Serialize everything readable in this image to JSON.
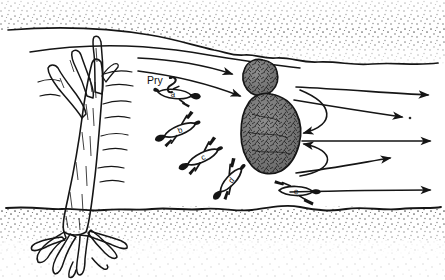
{
  "figure": {
    "type": "stream-habitat-plan-view-diagram",
    "background_color": "#ffffff",
    "ink_color": "#151515",
    "substrate_color": "#7d7d7d",
    "labels": {
      "prey": "Pry",
      "fish_a": "a",
      "fish_b": "b",
      "fish_c": "c",
      "fish_d": "d",
      "fish_e": "e"
    }
  },
  "banks": {
    "top": {
      "name": "upper-stippled-bank",
      "waterline": "M 8,30 C 60,26 108,28 150,35 C 190,42 220,50 262,56 C 305,62 360,66 438,63",
      "secondary_line": "M 30,52 C 80,44 130,44 176,50 C 212,55 246,62 300,68"
    },
    "bottom": {
      "name": "lower-stippled-bank",
      "waterline": "M 6,208 C 60,205 110,210 160,207 C 212,204 258,212 306,208 C 352,204 400,210 440,207"
    }
  },
  "snag": {
    "name": "fallen-tree-snag",
    "description": "tree trunk with forked upper branches and spreading root wad"
  },
  "boulders": [
    {
      "name": "boulder-upper",
      "cx": 259,
      "cy": 80,
      "rx": 18,
      "ry": 16
    },
    {
      "name": "boulder-lower",
      "cx": 272,
      "cy": 130,
      "rx": 30,
      "ry": 40
    }
  ],
  "flow_lines": [
    {
      "name": "flow-line-1",
      "path": "M 140,60 C 180,62 210,68 236,76",
      "arrow_at": [
        210,
        68.5
      ],
      "arrow_dir": 14
    },
    {
      "name": "flow-line-2",
      "path": "M 140,72 C 180,76 212,84 240,94",
      "arrow_at": [
        228,
        89
      ],
      "arrow_dir": 20
    },
    {
      "name": "flow-line-3",
      "path": "M 295,88 C 340,90 386,94 426,96",
      "arrow_at": [
        420,
        95.5
      ],
      "arrow_dir": 3
    },
    {
      "name": "flow-line-4",
      "path": "M 294,100 C 330,106 368,112 400,116",
      "arrow_at": [
        394,
        115
      ],
      "arrow_dir": 7
    },
    {
      "name": "flow-line-5",
      "path": "M 300,140 C 340,140 392,141 428,141",
      "arrow_at": [
        422,
        141
      ],
      "arrow_dir": 0
    },
    {
      "name": "flow-line-6",
      "path": "M 296,172 C 328,168 360,162 388,158",
      "arrow_at": [
        382,
        159
      ],
      "arrow_dir": -8
    },
    {
      "name": "flow-line-7",
      "path": "M 290,192 C 330,191 390,190 428,190",
      "arrow_at": [
        422,
        190
      ],
      "arrow_dir": 0
    }
  ],
  "eddies": [
    {
      "name": "eddy-upper-recirculation",
      "path": "M 302,88 C 336,104 336,124 300,134",
      "arrow_at": [
        306,
        133
      ],
      "arrow_dir": 178
    },
    {
      "name": "eddy-lower-recirculation",
      "path": "M 300,146 C 336,152 336,172 300,176",
      "arrow_at": [
        306,
        145
      ],
      "arrow_dir": 182
    }
  ],
  "fish": [
    {
      "id": "a",
      "name": "fish-a",
      "cx": 175,
      "cy": 94,
      "len": 34,
      "h": 10,
      "angle": 6,
      "head": "left",
      "tail": "right"
    },
    {
      "id": "b",
      "name": "fish-b",
      "cx": 180,
      "cy": 130,
      "len": 34,
      "h": 11,
      "angle": -22,
      "head": "right",
      "tail": "left"
    },
    {
      "id": "c",
      "name": "fish-c",
      "cx": 203,
      "cy": 157,
      "len": 34,
      "h": 11,
      "angle": -26,
      "head": "right",
      "tail": "left"
    },
    {
      "id": "d",
      "name": "fish-d",
      "cx": 231,
      "cy": 180,
      "len": 32,
      "h": 11,
      "angle": -48,
      "head": "right",
      "tail": "left"
    },
    {
      "id": "e",
      "name": "fish-e",
      "cx": 296,
      "cy": 191,
      "len": 34,
      "h": 11,
      "angle": 2,
      "head": "right",
      "tail": "left"
    }
  ],
  "prey": {
    "name": "prey-item",
    "x": 166,
    "y": 80
  }
}
